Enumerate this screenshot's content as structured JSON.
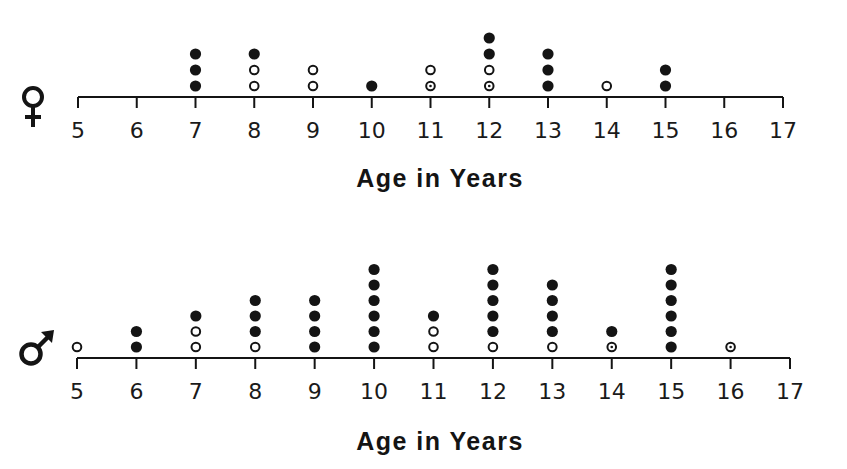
{
  "chart_data": [
    {
      "type": "scatter",
      "subtype": "dot-plot",
      "title": "",
      "group": "female",
      "group_symbol": "♀",
      "xlabel": "Age in Years",
      "ylabel": "",
      "xlim": [
        5,
        17
      ],
      "x_ticks": [
        5,
        6,
        7,
        8,
        9,
        10,
        11,
        12,
        13,
        14,
        15,
        16,
        17
      ],
      "grid": false,
      "legend": null,
      "marker_types": {
        "F": "filled circle",
        "O": "open circle",
        "D": "open circle with center dot"
      },
      "stacks": [
        {
          "age": 7,
          "markers": [
            "F",
            "F",
            "F"
          ]
        },
        {
          "age": 8,
          "markers": [
            "O",
            "O",
            "F"
          ]
        },
        {
          "age": 9,
          "markers": [
            "O",
            "O"
          ]
        },
        {
          "age": 10,
          "markers": [
            "F"
          ]
        },
        {
          "age": 11,
          "markers": [
            "D",
            "O"
          ]
        },
        {
          "age": 12,
          "markers": [
            "D",
            "O",
            "F",
            "F"
          ]
        },
        {
          "age": 13,
          "markers": [
            "F",
            "F",
            "F"
          ]
        },
        {
          "age": 14,
          "markers": [
            "O"
          ]
        },
        {
          "age": 15,
          "markers": [
            "F",
            "F"
          ]
        }
      ],
      "counts": {
        "7": 3,
        "8": 3,
        "9": 2,
        "10": 1,
        "11": 2,
        "12": 4,
        "13": 3,
        "14": 1,
        "15": 2
      }
    },
    {
      "type": "scatter",
      "subtype": "dot-plot",
      "title": "",
      "group": "male",
      "group_symbol": "♂",
      "xlabel": "Age in Years",
      "ylabel": "",
      "xlim": [
        5,
        17
      ],
      "x_ticks": [
        5,
        6,
        7,
        8,
        9,
        10,
        11,
        12,
        13,
        14,
        15,
        16,
        17
      ],
      "grid": false,
      "legend": null,
      "marker_types": {
        "F": "filled circle",
        "O": "open circle",
        "D": "open circle with center dot"
      },
      "stacks": [
        {
          "age": 5,
          "markers": [
            "O"
          ]
        },
        {
          "age": 6,
          "markers": [
            "F",
            "F"
          ]
        },
        {
          "age": 7,
          "markers": [
            "O",
            "O",
            "F"
          ]
        },
        {
          "age": 8,
          "markers": [
            "O",
            "F",
            "F",
            "F"
          ]
        },
        {
          "age": 9,
          "markers": [
            "F",
            "F",
            "F",
            "F"
          ]
        },
        {
          "age": 10,
          "markers": [
            "F",
            "F",
            "F",
            "F",
            "F",
            "F"
          ]
        },
        {
          "age": 11,
          "markers": [
            "O",
            "O",
            "F"
          ]
        },
        {
          "age": 12,
          "markers": [
            "O",
            "F",
            "F",
            "F",
            "F",
            "F"
          ]
        },
        {
          "age": 13,
          "markers": [
            "O",
            "F",
            "F",
            "F",
            "F"
          ]
        },
        {
          "age": 14,
          "markers": [
            "D",
            "F"
          ]
        },
        {
          "age": 15,
          "markers": [
            "F",
            "F",
            "F",
            "F",
            "F",
            "F"
          ]
        },
        {
          "age": 16,
          "markers": [
            "D"
          ]
        }
      ],
      "counts": {
        "5": 1,
        "6": 2,
        "7": 3,
        "8": 4,
        "9": 4,
        "10": 6,
        "11": 3,
        "12": 6,
        "13": 5,
        "14": 2,
        "15": 6,
        "16": 1
      }
    }
  ],
  "female": {
    "symbol_icon": "female-symbol-icon",
    "axis_title": "Age in Years"
  },
  "male": {
    "symbol_icon": "male-symbol-icon",
    "axis_title": "Age in Years"
  },
  "colors": {
    "ink": "#141414",
    "background": "#ffffff"
  }
}
